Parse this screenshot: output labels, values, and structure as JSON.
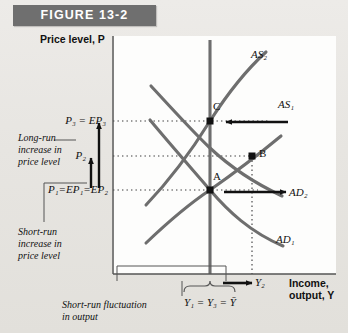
{
  "figure": {
    "banner_label": "FIGURE 13-2"
  },
  "axes": {
    "y_title": "Price level, P",
    "x_title_line1": "Income,",
    "x_title_line2": "output, Y"
  },
  "price_levels": [
    {
      "id": "p3",
      "label": "P3 = EP3",
      "text": "P₃ = EP₃",
      "y": 121
    },
    {
      "id": "p2",
      "label": "P2",
      "text": "P₂",
      "y": 156
    },
    {
      "id": "p1",
      "label": "P1 = EP1 = EP2",
      "text": "P₁=EP₁=EP₂",
      "y": 190
    }
  ],
  "output_levels": [
    {
      "id": "y_full",
      "text": "Y₁ = Y₃ = Ȳ",
      "x": 210
    },
    {
      "id": "y2",
      "text": "Y₂",
      "x": 252
    }
  ],
  "curves": [
    {
      "id": "as2",
      "label": "AS₂",
      "type": "short-run-aggregate-supply"
    },
    {
      "id": "as1",
      "label": "AS₁",
      "type": "short-run-aggregate-supply"
    },
    {
      "id": "ad2",
      "label": "AD₂",
      "type": "aggregate-demand"
    },
    {
      "id": "ad1",
      "label": "AD₁",
      "type": "aggregate-demand"
    },
    {
      "id": "lras",
      "label": "",
      "type": "long-run-aggregate-supply"
    }
  ],
  "equilibrium_points": [
    {
      "id": "A",
      "label": "A",
      "x": 210,
      "y": 190
    },
    {
      "id": "B",
      "label": "B",
      "x": 252,
      "y": 156
    },
    {
      "id": "C",
      "label": "C",
      "x": 210,
      "y": 121
    }
  ],
  "annotations": {
    "long_run_increase": "Long-run\nincrease in\nprice level",
    "long_run_increase_lines": [
      "Long-run",
      "increase in",
      "price level"
    ],
    "short_run_increase_lines": [
      "Short-run",
      "increase in",
      "price level"
    ],
    "short_run_fluctuation_lines": [
      "Short-run fluctuation",
      "in output"
    ]
  },
  "colors": {
    "banner_bg": "#6f6f6f",
    "banner_text": "#ffffff",
    "panel_bg": "#fdfdfc",
    "page_bg": "#e9e7e4",
    "curve": "#6e6e6e",
    "axis": "#555555",
    "arrow": "#111111",
    "dotted": "#3a3a3a"
  }
}
